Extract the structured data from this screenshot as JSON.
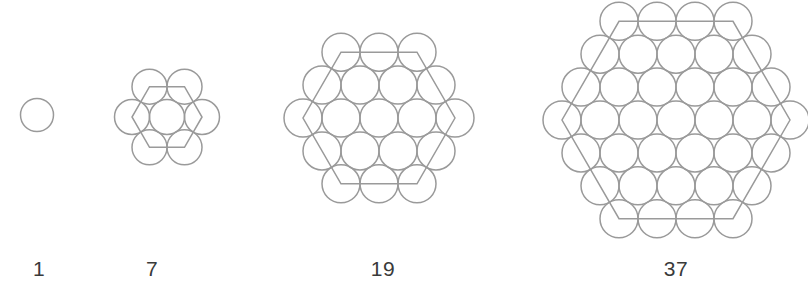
{
  "figure": {
    "caption_color": "#3a3a3a",
    "stroke_color": "#9a9a9a",
    "background_color": "#ffffff",
    "stroke_width": 1.5
  },
  "chart_data": {
    "type": "diagram",
    "title": "",
    "subtitle": "",
    "xlabel": "",
    "ylabel": "",
    "categories": [
      "1",
      "7",
      "19",
      "37"
    ],
    "values": [
      1,
      7,
      19,
      37
    ],
    "legend": [],
    "annotations": [],
    "figures": [
      {
        "label": "1",
        "count": 1,
        "rings": 0,
        "center_x": 37,
        "center_y": 115,
        "radius": 16.5,
        "spacing": 35,
        "row_counts": [
          1
        ],
        "show_hexagon": false,
        "label_x": 39,
        "label_y": 258
      },
      {
        "label": "7",
        "count": 7,
        "rings": 1,
        "center_x": 167,
        "center_y": 117,
        "radius": 17.5,
        "spacing": 35,
        "row_counts": [
          2,
          3,
          2
        ],
        "show_hexagon": true,
        "label_x": 152,
        "label_y": 258
      },
      {
        "label": "19",
        "count": 19,
        "rings": 2,
        "center_x": 379,
        "center_y": 118,
        "radius": 19,
        "spacing": 38,
        "row_counts": [
          3,
          4,
          5,
          4,
          3
        ],
        "show_hexagon": true,
        "label_x": 383,
        "label_y": 258
      },
      {
        "label": "37",
        "count": 37,
        "rings": 3,
        "center_x": 676,
        "center_y": 120,
        "radius": 19,
        "spacing": 38,
        "row_counts": [
          4,
          5,
          6,
          7,
          6,
          5,
          4
        ],
        "show_hexagon": true,
        "label_x": 676,
        "label_y": 258
      }
    ]
  }
}
